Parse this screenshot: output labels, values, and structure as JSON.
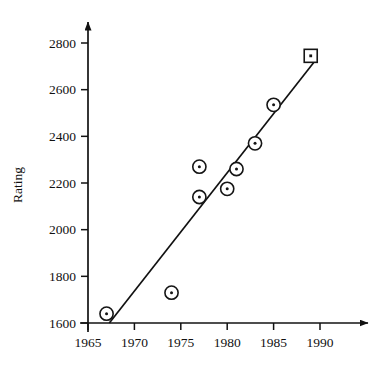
{
  "chart_data": {
    "type": "scatter",
    "title": "",
    "xlabel": "",
    "ylabel": "Rating",
    "xlim": [
      1965,
      1991
    ],
    "ylim": [
      1600,
      2850
    ],
    "grid": false,
    "legend": "none",
    "x_ticks": [
      1965,
      1970,
      1975,
      1980,
      1985,
      1990
    ],
    "y_ticks": [
      1600,
      1800,
      2000,
      2200,
      2400,
      2600,
      2800
    ],
    "x_tick_labels": [
      "1965",
      "1970",
      "1975",
      "1980",
      "1985",
      "1990"
    ],
    "y_tick_labels": [
      "1600",
      "1800",
      "2000",
      "2200",
      "2400",
      "2600",
      "2800"
    ],
    "series": [
      {
        "name": "observed",
        "marker": "circle-dot",
        "points": [
          {
            "x": 1967,
            "y": 1640
          },
          {
            "x": 1974,
            "y": 1730
          },
          {
            "x": 1977,
            "y": 2140
          },
          {
            "x": 1977,
            "y": 2270
          },
          {
            "x": 1980,
            "y": 2175
          },
          {
            "x": 1981,
            "y": 2260
          },
          {
            "x": 1983,
            "y": 2370
          },
          {
            "x": 1985,
            "y": 2535
          }
        ]
      },
      {
        "name": "predicted",
        "marker": "square-dot",
        "points": [
          {
            "x": 1989,
            "y": 2745
          }
        ]
      }
    ],
    "trend_line": {
      "name": "regression-line",
      "start": {
        "x": 1967.3,
        "y": 1600
      },
      "end": {
        "x": 1989.6,
        "y": 2730
      }
    }
  }
}
